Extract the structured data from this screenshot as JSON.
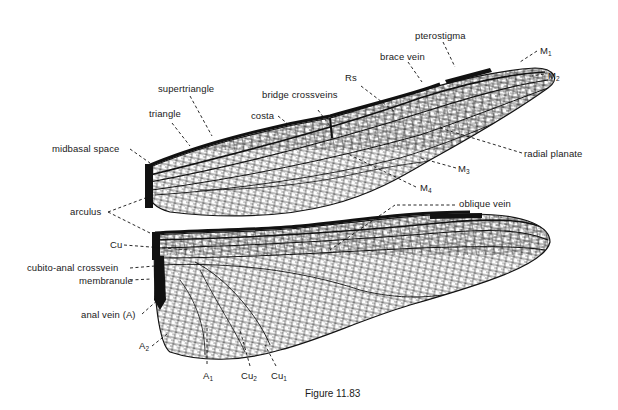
{
  "figure": {
    "caption": "Figure 11.83"
  },
  "labels": {
    "pterostigma": "pterostigma",
    "brace_vein": "brace vein",
    "m1": {
      "base": "M",
      "sub": "1"
    },
    "m2": {
      "base": "M",
      "sub": "2"
    },
    "rs": "Rs",
    "bridge_crossveins": "bridge crossveins",
    "supertriangle": "supertriangle",
    "triangle": "triangle",
    "costa": "costa",
    "midbasal_space": "midbasal space",
    "radial_planate": "radial planate",
    "m3": {
      "base": "M",
      "sub": "3"
    },
    "m4": {
      "base": "M",
      "sub": "4"
    },
    "arculus": "arculus",
    "oblique_vein": "oblique vein",
    "cu": "Cu",
    "cubito_anal_crossvein": "cubito-anal crossvein",
    "membranule": "membranule",
    "anal_vein": "anal vein (A)",
    "a2": {
      "base": "A",
      "sub": "2"
    },
    "a1": {
      "base": "A",
      "sub": "1"
    },
    "cu2": {
      "base": "Cu",
      "sub": "2"
    },
    "cu1": {
      "base": "Cu",
      "sub": "1"
    }
  },
  "colors": {
    "ink": "#111111",
    "background": "#ffffff"
  }
}
